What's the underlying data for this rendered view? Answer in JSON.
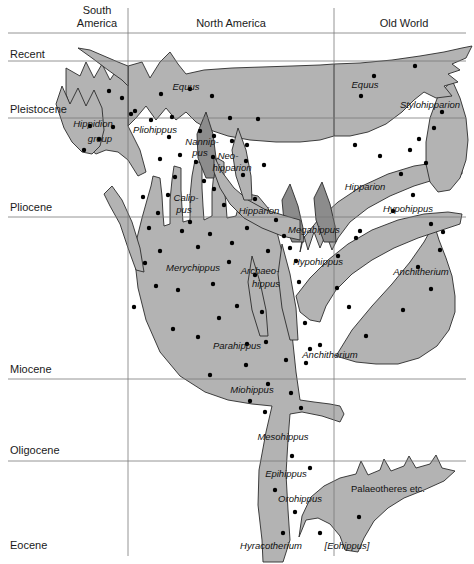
{
  "figure": {
    "type": "phylogeny-chart",
    "width": 474,
    "height": 564,
    "colors": {
      "clade_fill": "#b3b3b3",
      "clade_fill_dark": "#8c8c8c",
      "outline": "#2b2b2b",
      "grid": "#7a7a7a",
      "dot": "#000000",
      "background": "#ffffff"
    }
  },
  "columns": [
    {
      "id": "south-america",
      "label": "South\nAmerica",
      "line1": "South",
      "line2": "America",
      "x_center": 97,
      "x_right_divider": 128
    },
    {
      "id": "north-america",
      "label": "North America",
      "line1": "North America",
      "line2": "",
      "x_center": 231,
      "x_right_divider": 334
    },
    {
      "id": "old-world",
      "label": "Old World",
      "line1": "Old World",
      "line2": "",
      "x_center": 404,
      "x_right_divider": null
    }
  ],
  "epochs": [
    {
      "id": "recent",
      "label": "Recent",
      "text_y": 58,
      "line_y": 61
    },
    {
      "id": "pleistocene",
      "label": "Pleistocene",
      "text_y": 113,
      "line_y": 118
    },
    {
      "id": "pliocene",
      "label": "Pliocene",
      "text_y": 211,
      "line_y": 217
    },
    {
      "id": "miocene",
      "label": "Miocene",
      "text_y": 373,
      "line_y": 379
    },
    {
      "id": "oligocene",
      "label": "Oligocene",
      "text_y": 454,
      "line_y": 461
    },
    {
      "id": "eocene",
      "label": "Eocene",
      "text_y": 549,
      "line_y": null
    }
  ],
  "header_rule_y": 33,
  "taxa": [
    {
      "id": "equus-na",
      "label": "Equus",
      "x": 186,
      "y": 90,
      "italic": true,
      "rotate": 0
    },
    {
      "id": "equus-ow",
      "label": "Equus",
      "x": 365,
      "y": 88,
      "italic": true,
      "rotate": 0
    },
    {
      "id": "stylohipparion",
      "label": "Stylohipparion",
      "x": 430,
      "y": 108,
      "italic": true,
      "rotate": 0
    },
    {
      "id": "hippidion-group-l1",
      "label": "Hippidion",
      "x": 93,
      "y": 127,
      "italic": true,
      "rotate": 0
    },
    {
      "id": "hippidion-group-l2",
      "label": "group",
      "x": 100,
      "y": 142,
      "italic": true,
      "rotate": 0
    },
    {
      "id": "pliohippus",
      "label": "Pliohippus",
      "x": 155,
      "y": 133,
      "italic": true,
      "rotate": 0
    },
    {
      "id": "nannippus-l1",
      "label": "Nannip-",
      "x": 202,
      "y": 145,
      "italic": true,
      "rotate": 0
    },
    {
      "id": "nannippus-l2",
      "label": "pus",
      "x": 200,
      "y": 156,
      "italic": true,
      "rotate": 0
    },
    {
      "id": "neohipparion-l1",
      "label": "Neo-",
      "x": 228,
      "y": 159,
      "italic": true,
      "rotate": 0
    },
    {
      "id": "neohipparion-l2",
      "label": "hipparion",
      "x": 232,
      "y": 171,
      "italic": true,
      "rotate": 0
    },
    {
      "id": "calippus-l1",
      "label": "Calip-",
      "x": 186,
      "y": 201,
      "italic": true,
      "rotate": 0
    },
    {
      "id": "calippus-l2",
      "label": "pus",
      "x": 184,
      "y": 213,
      "italic": true,
      "rotate": 0
    },
    {
      "id": "hipparion-na",
      "label": "Hipparion",
      "x": 259,
      "y": 214,
      "italic": true,
      "rotate": 0
    },
    {
      "id": "hipparion-ow",
      "label": "Hipparion",
      "x": 365,
      "y": 190,
      "italic": true,
      "rotate": 0
    },
    {
      "id": "megahippus",
      "label": "Megahippus",
      "x": 314,
      "y": 233,
      "italic": true,
      "rotate": 0
    },
    {
      "id": "hypohippus-ow",
      "label": "Hypohippus",
      "x": 408,
      "y": 212,
      "italic": true,
      "rotate": 0
    },
    {
      "id": "hypohippus-na",
      "label": "Hypohippus",
      "x": 318,
      "y": 265,
      "italic": true,
      "rotate": 0
    },
    {
      "id": "merychippus",
      "label": "Merychippus",
      "x": 193,
      "y": 271,
      "italic": true,
      "rotate": 0
    },
    {
      "id": "archaeohippus-l1",
      "label": "Archaeo-",
      "x": 260,
      "y": 274,
      "italic": true,
      "rotate": 0
    },
    {
      "id": "archaeohippus-l2",
      "label": "hippus",
      "x": 266,
      "y": 287,
      "italic": true,
      "rotate": 0
    },
    {
      "id": "anchitherium-ow",
      "label": "Anchitherium",
      "x": 421,
      "y": 275,
      "italic": true,
      "rotate": 0
    },
    {
      "id": "parahippus",
      "label": "Parahippus",
      "x": 237,
      "y": 349,
      "italic": true,
      "rotate": 0
    },
    {
      "id": "anchitherium-na",
      "label": "Anchitherium",
      "x": 330,
      "y": 358,
      "italic": true,
      "rotate": 0
    },
    {
      "id": "miohippus",
      "label": "Miohippus",
      "x": 252,
      "y": 393,
      "italic": true,
      "rotate": 0
    },
    {
      "id": "mesohippus",
      "label": "Mesohippus",
      "x": 283,
      "y": 440,
      "italic": true,
      "rotate": 0
    },
    {
      "id": "epihippus",
      "label": "Epihippus",
      "x": 286,
      "y": 477,
      "italic": true,
      "rotate": 0
    },
    {
      "id": "orohippus",
      "label": "Orohippus",
      "x": 300,
      "y": 502,
      "italic": true,
      "rotate": 0
    },
    {
      "id": "palaeotheres",
      "label": "Palaeotheres  etc.",
      "x": 388,
      "y": 492,
      "italic": false,
      "rotate": 0
    },
    {
      "id": "hyracotherium",
      "label": "Hyracotherium",
      "x": 271,
      "y": 549,
      "italic": true,
      "rotate": 0
    },
    {
      "id": "eohippus-bracket",
      "label": "[Eohippus]",
      "x": 347,
      "y": 549,
      "italic": true,
      "rotate": 0
    }
  ],
  "fossil_dots": [
    [
      109,
      91
    ],
    [
      122,
      98
    ],
    [
      135,
      111
    ],
    [
      90,
      126
    ],
    [
      113,
      127
    ],
    [
      99,
      139
    ],
    [
      84,
      150
    ],
    [
      161,
      94
    ],
    [
      190,
      89
    ],
    [
      212,
      96
    ],
    [
      151,
      120
    ],
    [
      172,
      117
    ],
    [
      131,
      114
    ],
    [
      230,
      118
    ],
    [
      258,
      119
    ],
    [
      169,
      137
    ],
    [
      200,
      131
    ],
    [
      214,
      136
    ],
    [
      180,
      155
    ],
    [
      232,
      141
    ],
    [
      247,
      145
    ],
    [
      160,
      159
    ],
    [
      196,
      162
    ],
    [
      213,
      157
    ],
    [
      246,
      161
    ],
    [
      175,
      177
    ],
    [
      204,
      181
    ],
    [
      243,
      175
    ],
    [
      264,
      165
    ],
    [
      143,
      197
    ],
    [
      168,
      195
    ],
    [
      214,
      189
    ],
    [
      158,
      213
    ],
    [
      190,
      222
    ],
    [
      224,
      205
    ],
    [
      255,
      199
    ],
    [
      149,
      228
    ],
    [
      182,
      231
    ],
    [
      210,
      234
    ],
    [
      247,
      228
    ],
    [
      276,
      220
    ],
    [
      160,
      251
    ],
    [
      198,
      247
    ],
    [
      232,
      243
    ],
    [
      268,
      251
    ],
    [
      145,
      263
    ],
    [
      229,
      262
    ],
    [
      255,
      275
    ],
    [
      290,
      248
    ],
    [
      156,
      286
    ],
    [
      178,
      290
    ],
    [
      213,
      284
    ],
    [
      299,
      282
    ],
    [
      173,
      329
    ],
    [
      219,
      318
    ],
    [
      262,
      312
    ],
    [
      305,
      323
    ],
    [
      134,
      307
    ],
    [
      198,
      337
    ],
    [
      237,
      306
    ],
    [
      266,
      342
    ],
    [
      247,
      344
    ],
    [
      310,
      349
    ],
    [
      286,
      360
    ],
    [
      246,
      365
    ],
    [
      210,
      375
    ],
    [
      268,
      384
    ],
    [
      306,
      363
    ],
    [
      291,
      393
    ],
    [
      250,
      401
    ],
    [
      361,
      96
    ],
    [
      374,
      76
    ],
    [
      415,
      66
    ],
    [
      442,
      112
    ],
    [
      434,
      128
    ],
    [
      419,
      139
    ],
    [
      410,
      150
    ],
    [
      426,
      163
    ],
    [
      401,
      174
    ],
    [
      355,
      145
    ],
    [
      380,
      156
    ],
    [
      413,
      195
    ],
    [
      360,
      231
    ],
    [
      393,
      211
    ],
    [
      431,
      224
    ],
    [
      443,
      232
    ],
    [
      440,
      250
    ],
    [
      418,
      267
    ],
    [
      431,
      289
    ],
    [
      403,
      310
    ],
    [
      366,
      336
    ],
    [
      349,
      307
    ],
    [
      320,
      345
    ],
    [
      265,
      412
    ],
    [
      301,
      408
    ],
    [
      292,
      456
    ],
    [
      310,
      468
    ],
    [
      275,
      490
    ],
    [
      295,
      512
    ],
    [
      283,
      533
    ],
    [
      320,
      533
    ],
    [
      359,
      517
    ],
    [
      356,
      238
    ],
    [
      338,
      256
    ],
    [
      337,
      288
    ],
    [
      284,
      236
    ],
    [
      296,
      261
    ]
  ],
  "chart_data": {
    "type": "phylogeny",
    "xlabel": "Geographic region",
    "ylabel": "Geological epoch",
    "categories": [
      "South America",
      "North America",
      "Old World"
    ],
    "axis_ticks": [
      "Recent",
      "Pleistocene",
      "Pliocene",
      "Miocene",
      "Oligocene",
      "Eocene"
    ],
    "genera": [
      "Equus",
      "Stylohipparion",
      "Hippidion group",
      "Pliohippus",
      "Nannippus",
      "Neohipparion",
      "Calippus",
      "Hipparion",
      "Megahippus",
      "Hypohippus",
      "Merychippus",
      "Archaeohippus",
      "Anchitherium",
      "Parahippus",
      "Miohippus",
      "Mesohippus",
      "Epihippus",
      "Orohippus",
      "Palaeotheres etc.",
      "Hyracotherium [Eohippus]"
    ],
    "grid": true,
    "legend": "none"
  }
}
